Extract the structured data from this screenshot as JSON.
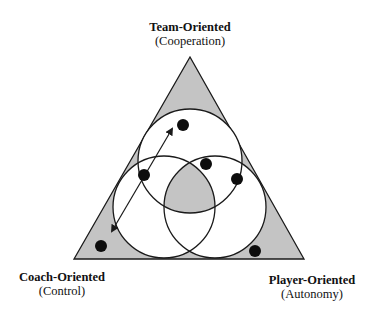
{
  "labels": {
    "top": {
      "title": "Team-Oriented",
      "sub": "(Cooperation)"
    },
    "left": {
      "title": "Coach-Oriented",
      "sub": "(Control)"
    },
    "right": {
      "title": "Player-Oriented",
      "sub": "(Autonomy)"
    }
  },
  "colors": {
    "shade": "#c4c4c4",
    "stroke": "#1a1a1a",
    "background": "#ffffff"
  },
  "diagram": {
    "triangle": {
      "apex": [
        190,
        57
      ],
      "left": [
        74,
        259
      ],
      "right": [
        304,
        259
      ]
    },
    "circles": [
      {
        "name": "team",
        "cx": 190,
        "cy": 161,
        "r": 52
      },
      {
        "name": "coach",
        "cx": 164,
        "cy": 207,
        "r": 51
      },
      {
        "name": "player",
        "cx": 215,
        "cy": 207,
        "r": 51
      }
    ],
    "dots": [
      {
        "cx": 183,
        "cy": 125
      },
      {
        "cx": 206,
        "cy": 164
      },
      {
        "cx": 144,
        "cy": 175
      },
      {
        "cx": 237,
        "cy": 179
      },
      {
        "cx": 101,
        "cy": 246
      },
      {
        "cx": 255,
        "cy": 251
      }
    ],
    "arrow": {
      "from": [
        112,
        231
      ],
      "to": [
        172,
        129
      ],
      "double_headed": true
    }
  }
}
